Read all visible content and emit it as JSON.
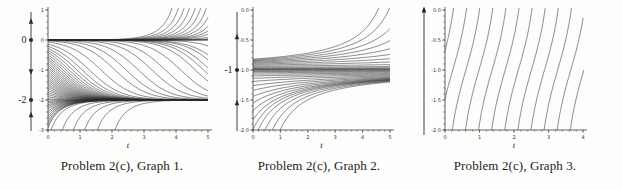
{
  "figure": {
    "description_visible_text_only": true
  },
  "chart_data": [
    {
      "type": "line",
      "title": "Problem 2(c), Graph 1.",
      "xlabel": "t",
      "ylabel": "",
      "xlim": [
        0,
        5
      ],
      "ylim": [
        -3,
        1
      ],
      "xticks": [
        {
          "label": "0",
          "value": 0
        },
        {
          "label": "1",
          "value": 1
        },
        {
          "label": "2",
          "value": 2
        },
        {
          "label": "3",
          "value": 3
        },
        {
          "label": "4",
          "value": 4
        },
        {
          "label": "5",
          "value": 5
        }
      ],
      "yticks": [
        {
          "label": "1",
          "value": 1
        },
        {
          "label": "0",
          "value": 0
        },
        {
          "label": "-1",
          "value": -1
        },
        {
          "label": "-2",
          "value": -2
        },
        {
          "label": "-3",
          "value": -3
        }
      ],
      "x_minor_step": 0.2,
      "y_minor_step": 0.2,
      "grid": false,
      "equilibria": [
        0,
        -2
      ],
      "phase_line": {
        "labels": [
          {
            "text": "0",
            "y": 0
          },
          {
            "text": "-2",
            "y": -2
          }
        ],
        "dots": [
          0,
          -2
        ],
        "arrows": [
          {
            "y": 0.62,
            "dir": "up"
          },
          {
            "y": -1.05,
            "dir": "down"
          },
          {
            "y": -2.5,
            "dir": "up"
          }
        ],
        "axis_arrow": false
      },
      "ode_poly_coeffs": [
        0,
        2,
        1
      ],
      "initial_conditions": [
        [
          0,
          0.0003
        ],
        [
          0,
          0.0002
        ],
        [
          0,
          0.00014
        ],
        [
          0,
          0.0001
        ],
        [
          0,
          7e-05
        ],
        [
          0,
          5e-05
        ],
        [
          0,
          3.5e-05
        ],
        [
          0,
          2.5e-05
        ],
        [
          0,
          1.7e-05
        ],
        [
          0,
          1.2e-05
        ],
        [
          0,
          8e-06
        ],
        [
          0,
          4e-06
        ],
        [
          0,
          1.5e-06
        ],
        [
          0,
          5e-07
        ],
        [
          0,
          1e-07
        ],
        [
          0,
          0
        ],
        [
          0,
          -2
        ],
        [
          0,
          -0.07
        ],
        [
          0,
          -0.14
        ],
        [
          0,
          -0.21
        ],
        [
          0,
          -0.28
        ],
        [
          0,
          -0.35
        ],
        [
          0,
          -0.42
        ],
        [
          0,
          -0.49
        ],
        [
          0,
          -0.56
        ],
        [
          0,
          -0.63
        ],
        [
          0,
          -0.7
        ],
        [
          0,
          -0.77
        ],
        [
          0,
          -0.84
        ],
        [
          0,
          -0.91
        ],
        [
          0,
          -0.98
        ],
        [
          0,
          -1.05
        ],
        [
          0,
          -1.12
        ],
        [
          0,
          -1.19
        ],
        [
          0,
          -1.26
        ],
        [
          0,
          -1.33
        ],
        [
          0,
          -1.4
        ],
        [
          0,
          -1.47
        ],
        [
          0,
          -1.54
        ],
        [
          0,
          -1.61
        ],
        [
          0,
          -1.68
        ],
        [
          0,
          -1.75
        ],
        [
          0,
          -1.82
        ],
        [
          0,
          -1.89
        ],
        [
          0,
          -1.96
        ],
        [
          0,
          -0.03
        ],
        [
          0,
          -0.015
        ],
        [
          0,
          -0.007
        ],
        [
          0,
          -0.003
        ],
        [
          0,
          -0.0013
        ],
        [
          0,
          -0.0005
        ],
        [
          0,
          -0.0002
        ],
        [
          0,
          -0.00012
        ],
        [
          0,
          -8e-05
        ],
        [
          0,
          -4.5e-05
        ],
        [
          0,
          -3e-05
        ],
        [
          0,
          -1e-05
        ],
        [
          0,
          -2.05
        ],
        [
          0,
          -2.1
        ],
        [
          0,
          -2.16
        ],
        [
          0,
          -2.22
        ],
        [
          0,
          -2.29
        ],
        [
          0,
          -2.37
        ],
        [
          0,
          -2.45
        ],
        [
          0,
          -2.54
        ],
        [
          0,
          -2.63
        ],
        [
          0,
          -2.73
        ],
        [
          0,
          -2.83
        ],
        [
          0,
          -2.93
        ],
        [
          0.1,
          -2.99
        ],
        [
          0.45,
          -2.99
        ],
        [
          0.8,
          -2.99
        ],
        [
          1.15,
          -2.99
        ],
        [
          1.55,
          -2.99
        ],
        [
          2.1,
          -2.99
        ]
      ]
    },
    {
      "type": "line",
      "title": "Problem 2(c), Graph 2.",
      "xlabel": "t",
      "ylabel": "",
      "xlim": [
        0,
        5
      ],
      "ylim": [
        -2,
        0
      ],
      "xticks": [
        {
          "label": "0",
          "value": 0
        },
        {
          "label": "1",
          "value": 1
        },
        {
          "label": "2",
          "value": 2
        },
        {
          "label": "3",
          "value": 3
        },
        {
          "label": "4",
          "value": 4
        },
        {
          "label": "5",
          "value": 5
        }
      ],
      "yticks": [
        {
          "label": "0.0",
          "value": 0
        },
        {
          "label": "-0.5",
          "value": -0.5
        },
        {
          "label": "-1.0",
          "value": -1
        },
        {
          "label": "-1.5",
          "value": -1.5
        },
        {
          "label": "-2.0",
          "value": -2
        }
      ],
      "x_minor_step": 0.2,
      "y_minor_step": 0.1,
      "grid": false,
      "equilibria": [
        -1
      ],
      "phase_line": {
        "labels": [
          {
            "text": "-1",
            "y": -1
          }
        ],
        "dots": [
          -1
        ],
        "arrows": [
          {
            "y": -0.45,
            "dir": "up"
          },
          {
            "y": -1.55,
            "dir": "up"
          }
        ],
        "axis_arrow": false
      },
      "ode_poly_coeffs": [
        1,
        2,
        1
      ],
      "initial_conditions": [
        [
          0,
          -0.82
        ],
        [
          0,
          -0.832
        ],
        [
          0,
          -0.845
        ],
        [
          0,
          -0.858
        ],
        [
          0,
          -0.872
        ],
        [
          0,
          -0.887
        ],
        [
          0,
          -0.903
        ],
        [
          0,
          -0.92
        ],
        [
          0,
          -0.938
        ],
        [
          0,
          -0.955
        ],
        [
          0,
          -0.968
        ],
        [
          0,
          -0.978
        ],
        [
          0,
          -0.986
        ],
        [
          0,
          -0.993
        ],
        [
          0,
          -1
        ],
        [
          0,
          -1.83
        ],
        [
          0,
          -1.68
        ],
        [
          0,
          -1.55
        ],
        [
          0,
          -1.44
        ],
        [
          0,
          -1.34
        ],
        [
          0,
          -1.26
        ],
        [
          0,
          -1.19
        ],
        [
          0,
          -1.14
        ],
        [
          0,
          -1.1
        ],
        [
          0,
          -1.07
        ],
        [
          0,
          -1.045
        ],
        [
          0,
          -1.025
        ],
        [
          0,
          -1.012
        ],
        [
          0,
          -1.99
        ],
        [
          0.2,
          -1.99
        ],
        [
          0.45,
          -1.99
        ],
        [
          0.72,
          -1.99
        ],
        [
          1.0,
          -1.99
        ]
      ]
    },
    {
      "type": "line",
      "title": "Problem 2(c), Graph 3.",
      "xlabel": "t",
      "ylabel": "",
      "xlim": [
        0,
        4
      ],
      "ylim": [
        -2,
        0
      ],
      "xticks": [
        {
          "label": "0",
          "value": 0
        },
        {
          "label": "1",
          "value": 1
        },
        {
          "label": "2",
          "value": 2
        },
        {
          "label": "3",
          "value": 3
        },
        {
          "label": "4",
          "value": 4
        }
      ],
      "yticks": [
        {
          "label": "0.0",
          "value": 0
        },
        {
          "label": "-0.5",
          "value": -0.5
        },
        {
          "label": "-1.0",
          "value": -1
        },
        {
          "label": "-1.5",
          "value": -1.5
        },
        {
          "label": "-2.0",
          "value": -2
        }
      ],
      "x_minor_step": 0.2,
      "y_minor_step": 0.1,
      "grid": false,
      "equilibria": [],
      "phase_line": {
        "labels": [],
        "dots": [],
        "arrows": [],
        "axis_arrow": true
      },
      "ode_poly_coeffs": [
        4,
        4,
        2
      ],
      "initial_conditions": [
        [
          -0.155,
          -1
        ],
        [
          0.225,
          -1
        ],
        [
          0.605,
          -1
        ],
        [
          0.985,
          -1
        ],
        [
          1.365,
          -1
        ],
        [
          1.745,
          -1
        ],
        [
          2.125,
          -1
        ],
        [
          2.505,
          -1
        ],
        [
          2.885,
          -1
        ],
        [
          3.265,
          -1
        ],
        [
          3.645,
          -1
        ],
        [
          4.025,
          -1
        ]
      ]
    }
  ],
  "style": {
    "curve_color": "#2e2e2e",
    "axis_color": "#3c3c3c",
    "tick_label_color": "#333333",
    "phase_color": "#2a2a2a",
    "background": "#fdfdfc"
  }
}
